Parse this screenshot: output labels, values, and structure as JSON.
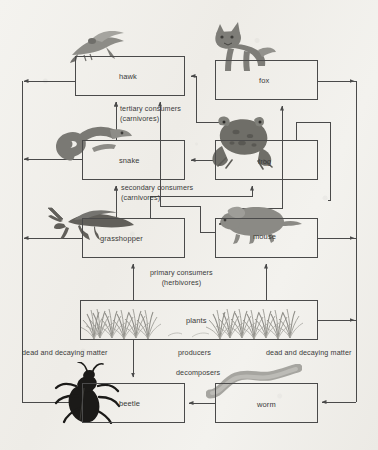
{
  "diagram": {
    "type": "food-web-diagram",
    "background_color": "#f2f1ed",
    "line_color": "#4a4a4a",
    "text_color": "#3a3a3a",
    "nodes": [
      {
        "id": "hawk",
        "label": "hawk",
        "x": 75,
        "y": 56,
        "w": 110,
        "h": 40,
        "level": "tertiary"
      },
      {
        "id": "fox",
        "label": "fox",
        "x": 215,
        "y": 60,
        "w": 103,
        "h": 40,
        "level": "tertiary"
      },
      {
        "id": "snake",
        "label": "snake",
        "x": 82,
        "y": 140,
        "w": 103,
        "h": 40,
        "level": "secondary"
      },
      {
        "id": "frog",
        "label": "frog",
        "x": 215,
        "y": 140,
        "w": 103,
        "h": 40,
        "level": "secondary"
      },
      {
        "id": "grasshopper",
        "label": "grasshopper",
        "x": 82,
        "y": 218,
        "w": 103,
        "h": 40,
        "level": "primary"
      },
      {
        "id": "mouse",
        "label": "mouse",
        "x": 215,
        "y": 218,
        "w": 103,
        "h": 40,
        "level": "primary"
      },
      {
        "id": "plants",
        "label": "plants",
        "x": 80,
        "y": 300,
        "w": 238,
        "h": 40,
        "level": "producer"
      },
      {
        "id": "beetle",
        "label": "beetle",
        "x": 82,
        "y": 383,
        "w": 103,
        "h": 40,
        "level": "decomposer"
      },
      {
        "id": "worm",
        "label": "worm",
        "x": 215,
        "y": 383,
        "w": 103,
        "h": 40,
        "level": "decomposer"
      }
    ],
    "trophic_labels": [
      {
        "id": "tertiary",
        "line1": "tertiary consumers",
        "line2": "(carnivores)",
        "x": 120,
        "y": 104,
        "align": "left"
      },
      {
        "id": "secondary",
        "line1": "secondary consumers",
        "line2": "(carnivores)",
        "x": 120,
        "y": 183,
        "align": "left"
      },
      {
        "id": "primary",
        "line1": "primary consumers",
        "line2": "(herbivores)",
        "x": 150,
        "y": 268,
        "align": "center"
      },
      {
        "id": "producers",
        "line1": "producers",
        "line2": "",
        "x": 200,
        "y": 349,
        "align": "center"
      },
      {
        "id": "decomposers",
        "line1": "decomposers",
        "line2": "",
        "x": 210,
        "y": 369,
        "align": "center"
      }
    ],
    "matter_labels": [
      {
        "id": "dead-matter-left",
        "text": "dead and decaying matter",
        "x": 22,
        "y": 349,
        "align": "left"
      },
      {
        "id": "dead-matter-right",
        "text": "dead and decaying matter",
        "x": 268,
        "y": 349,
        "align": "left"
      }
    ],
    "organism_art": [
      {
        "id": "hawk-art",
        "for": "hawk",
        "glyph": "bird"
      },
      {
        "id": "fox-art",
        "for": "fox",
        "glyph": "fox"
      },
      {
        "id": "snake-art",
        "for": "snake",
        "glyph": "snake"
      },
      {
        "id": "frog-art",
        "for": "frog",
        "glyph": "frog"
      },
      {
        "id": "grasshopper-art",
        "for": "grasshopper",
        "glyph": "grasshopper"
      },
      {
        "id": "mouse-art",
        "for": "mouse",
        "glyph": "mouse"
      },
      {
        "id": "plants-art",
        "for": "plants",
        "glyph": "grass"
      },
      {
        "id": "beetle-art",
        "for": "beetle",
        "glyph": "beetle"
      },
      {
        "id": "worm-art",
        "for": "worm",
        "glyph": "worm"
      }
    ],
    "flows": [
      {
        "from": "plants",
        "to": "grasshopper"
      },
      {
        "from": "plants",
        "to": "mouse"
      },
      {
        "from": "plants",
        "to": "beetle"
      },
      {
        "from": "grasshopper",
        "to": "snake"
      },
      {
        "from": "grasshopper",
        "to": "frog"
      },
      {
        "from": "mouse",
        "to": "hawk"
      },
      {
        "from": "mouse",
        "to": "fox"
      },
      {
        "from": "snake",
        "to": "hawk"
      },
      {
        "from": "frog",
        "to": "snake"
      },
      {
        "from": "frog",
        "to": "hawk"
      },
      {
        "from": "frog",
        "to": "fox"
      },
      {
        "from": "hawk",
        "to": "beetle"
      },
      {
        "from": "snake",
        "to": "beetle"
      },
      {
        "from": "grasshopper",
        "to": "beetle"
      },
      {
        "from": "fox",
        "to": "worm"
      },
      {
        "from": "mouse",
        "to": "worm"
      },
      {
        "from": "plants",
        "to": "worm"
      },
      {
        "from": "worm",
        "to": "beetle"
      }
    ]
  }
}
